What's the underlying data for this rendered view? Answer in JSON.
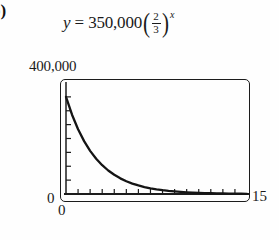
{
  "figure": {
    "part_label": "b)",
    "equation": {
      "lhs": "y",
      "equals": "=",
      "coefficient": "350,000",
      "paren_open": "(",
      "paren_close": ")",
      "fraction_numerator": "2",
      "fraction_denominator": "3",
      "exponent": "x",
      "plain_text": "y = 350,000(2/3)^x"
    },
    "labels": {
      "y_max": "400,000",
      "y_min": "0",
      "x_min": "0",
      "x_max": "15"
    },
    "colors": {
      "curve": "#141414",
      "frame": "#1c1c1c",
      "axis": "#1c1c1c",
      "background": "#fefefe",
      "text": "#1a1a1a"
    }
  },
  "chart_data": {
    "type": "line",
    "title": "",
    "subtitle": "",
    "xlabel": "",
    "ylabel": "",
    "xlim": [
      0,
      15
    ],
    "ylim": [
      0,
      400000
    ],
    "grid": false,
    "legend": null,
    "x_tick_labels": [
      "0",
      "15"
    ],
    "y_tick_labels": [
      "0",
      "400,000"
    ],
    "x_tick_count": 15,
    "y_tick_count": 8,
    "x_tick_interval": 1,
    "y_tick_interval": 50000,
    "function": "y = 350000 * (2/3)^x",
    "series": [
      {
        "name": "y = 350,000(2/3)^x",
        "x": [
          0,
          0.5,
          1,
          1.5,
          2,
          2.5,
          3,
          3.5,
          4,
          4.5,
          5,
          5.5,
          6,
          6.5,
          7,
          7.5,
          8,
          8.5,
          9,
          9.5,
          10,
          10.5,
          11,
          11.5,
          12,
          12.5,
          13,
          13.5,
          14,
          14.5,
          15
        ],
        "values": [
          350000,
          285774,
          233333,
          190516,
          155556,
          127011,
          103704,
          84674,
          69136,
          56449,
          46091,
          37633,
          30727,
          25089,
          20485,
          16726,
          13657,
          11151,
          9104,
          7434,
          6070,
          4956,
          4046,
          3304,
          2698,
          2203,
          1798,
          1468,
          1199,
          979,
          799
        ]
      }
    ]
  }
}
